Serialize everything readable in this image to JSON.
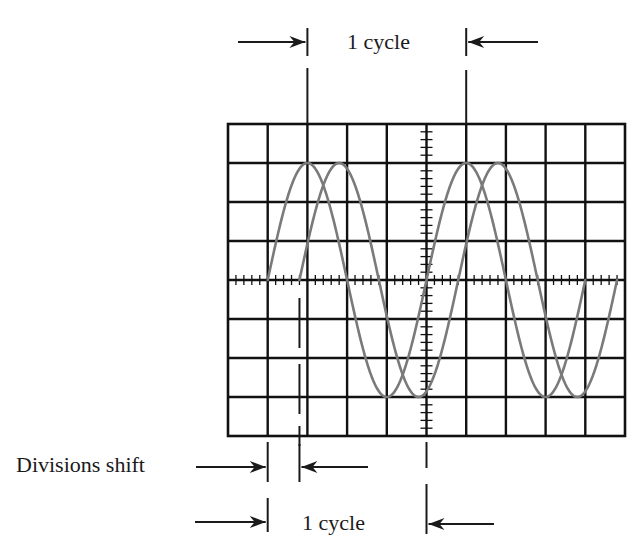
{
  "annotations": {
    "top_cycle_label": "1 cycle",
    "bottom_cycle_label": "1 cycle",
    "shift_label": "Divisions shift"
  },
  "colors": {
    "grid": "#111111",
    "trace": "#7a7a7a",
    "text": "#1a1a1a"
  },
  "chart_data": {
    "type": "line",
    "title": "",
    "xlabel": "Horizontal divisions",
    "ylabel": "Vertical divisions",
    "graticule": {
      "x_divisions": 10,
      "y_divisions": 8,
      "minor_ticks_per_division": 5
    },
    "xlim": [
      0,
      10
    ],
    "ylim": [
      -4,
      4
    ],
    "grid": true,
    "series": [
      {
        "name": "Reference waveform",
        "amplitude_div": 3,
        "period_div": 4,
        "start_div": 1.0,
        "end_div": 9.0
      },
      {
        "name": "Shifted waveform",
        "amplitude_div": 3,
        "period_div": 4,
        "start_div": 1.8,
        "end_div": 9.8
      }
    ],
    "measurements": {
      "cycle_length_div": 4,
      "shift_div": 0.8,
      "top_cycle_markers_div": [
        2,
        6
      ],
      "bottom_cycle_markers_div": [
        1,
        5
      ],
      "shift_markers_div": [
        1,
        1.8
      ]
    }
  }
}
